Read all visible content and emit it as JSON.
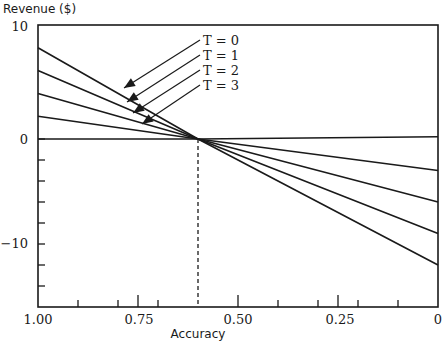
{
  "chart_data": {
    "type": "line",
    "title": "",
    "xlabel": "Accuracy",
    "ylabel": "Revenue ($)",
    "xlim": [
      1.0,
      0.0
    ],
    "ylim": [
      -16,
      10
    ],
    "x_reversed": true,
    "x_ticks_major": [
      1.0,
      0.75,
      0.5,
      0.25,
      0
    ],
    "x_tick_labels": [
      "1.00",
      "0.75",
      "0.50",
      "0.25",
      "0"
    ],
    "x_ticks_minor": [
      0.9,
      0.8,
      0.7,
      0.4,
      0.3,
      0.2,
      0.1
    ],
    "y_ticks": [
      10,
      0,
      -10
    ],
    "y_tick_labels": [
      "10",
      "0",
      "−10"
    ],
    "y_ticks_minor": [
      -2,
      -4,
      -6,
      -8,
      -12,
      -14
    ],
    "grid": false,
    "reference_line": {
      "x": 0.6,
      "style": "dashed",
      "from_y": 0,
      "to_y": -16
    },
    "x": [
      1.0,
      0.6,
      0.0
    ],
    "series": [
      {
        "name": "T = 0",
        "values": [
          8,
          0,
          -12
        ]
      },
      {
        "name": "T = 1",
        "values": [
          6,
          0,
          -9
        ]
      },
      {
        "name": "T = 2",
        "values": [
          4,
          0,
          -6
        ]
      },
      {
        "name": "T = 3",
        "values": [
          2,
          0,
          -3
        ]
      },
      {
        "name": "baseline",
        "values": [
          0,
          0,
          0.2
        ]
      }
    ],
    "annotations": [
      {
        "text": "T = 0",
        "arrow_to_series": "T = 0"
      },
      {
        "text": "T = 1",
        "arrow_to_series": "T = 1"
      },
      {
        "text": "T = 2",
        "arrow_to_series": "T = 2"
      },
      {
        "text": "T = 3",
        "arrow_to_series": "T = 3"
      }
    ]
  },
  "labels": {
    "ylabel": "Revenue ($)",
    "xlabel": "Accuracy",
    "series": [
      "T = 0",
      "T = 1",
      "T = 2",
      "T = 3"
    ],
    "xticks": [
      "1.00",
      "0.75",
      "0.50",
      "0.25",
      "0"
    ],
    "yticks": [
      "10",
      "0",
      "−10"
    ]
  }
}
